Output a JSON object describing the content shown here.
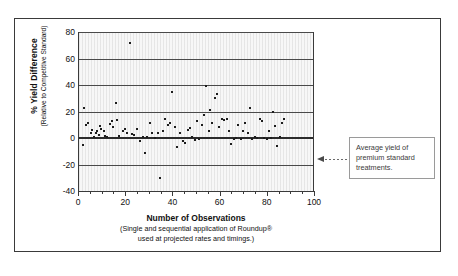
{
  "figure": {
    "frame_border_color": "#3a3a3a",
    "shadow_color": "#8d8d8d",
    "plot_background": "#f7f7f7"
  },
  "annotation": {
    "line1": "Average yield of",
    "line2": "premium standard",
    "line3": "treatments.",
    "arrow_icon": "dotted-left-arrow-icon"
  },
  "chart_data": {
    "type": "scatter",
    "title": "",
    "xlabel": "Number of Observations",
    "xlabel_sub1": "(Single and sequential application of Roundup®",
    "xlabel_sub2": "used at projected rates and timings.)",
    "ylabel": "% Yield Difference",
    "ylabel_sub": "(Relative to Competitive Standard)",
    "xlim": [
      0,
      100
    ],
    "ylim": [
      -40,
      80
    ],
    "xticks": [
      0,
      20,
      40,
      60,
      80,
      100
    ],
    "xtick_labels": [
      "0",
      "20",
      "40",
      "60",
      "80",
      "100"
    ],
    "x_minor_tick_step": 5,
    "yticks": [
      80,
      60,
      40,
      20,
      0,
      -20,
      -40
    ],
    "ytick_labels": [
      "80",
      "60",
      "40",
      "20",
      "0",
      "-20",
      "-40"
    ],
    "grid": "horizontal",
    "reference_line": {
      "y": 0,
      "label": "Average yield of premium standard treatments."
    },
    "legend": "none",
    "marker_color": "#1d1d1d",
    "points": [
      [
        1.5,
        -5.5
      ],
      [
        2.0,
        23.0
      ],
      [
        3.0,
        9.5
      ],
      [
        4.0,
        11.0
      ],
      [
        5.0,
        3.5
      ],
      [
        5.5,
        6.0
      ],
      [
        6.5,
        1.0
      ],
      [
        7.0,
        4.0
      ],
      [
        7.5,
        5.0
      ],
      [
        8.5,
        2.0
      ],
      [
        9.0,
        9.0
      ],
      [
        9.5,
        6.5
      ],
      [
        10.5,
        5.0
      ],
      [
        11.0,
        1.5
      ],
      [
        12.0,
        0.5
      ],
      [
        13.0,
        10.5
      ],
      [
        14.0,
        13.0
      ],
      [
        14.5,
        8.0
      ],
      [
        15.5,
        26.5
      ],
      [
        16.0,
        13.5
      ],
      [
        17.0,
        1.5
      ],
      [
        18.5,
        5.5
      ],
      [
        19.5,
        6.5
      ],
      [
        20.5,
        4.0
      ],
      [
        21.5,
        71.5
      ],
      [
        22.5,
        3.0
      ],
      [
        23.5,
        2.0
      ],
      [
        24.5,
        6.5
      ],
      [
        26.0,
        -2.0
      ],
      [
        27.0,
        1.0
      ],
      [
        28.0,
        -11.5
      ],
      [
        29.0,
        0.5
      ],
      [
        30.0,
        11.0
      ],
      [
        31.0,
        4.0
      ],
      [
        32.0,
        0.0
      ],
      [
        33.5,
        3.5
      ],
      [
        34.5,
        -30.5
      ],
      [
        35.5,
        5.5
      ],
      [
        36.5,
        14.0
      ],
      [
        37.5,
        9.5
      ],
      [
        38.5,
        11.0
      ],
      [
        39.5,
        34.5
      ],
      [
        40.5,
        8.0
      ],
      [
        41.5,
        -6.5
      ],
      [
        43.0,
        4.0
      ],
      [
        44.0,
        -2.5
      ],
      [
        45.0,
        -3.5
      ],
      [
        46.0,
        6.0
      ],
      [
        47.0,
        7.5
      ],
      [
        48.0,
        0.5
      ],
      [
        49.0,
        -1.5
      ],
      [
        50.0,
        12.5
      ],
      [
        51.0,
        -0.5
      ],
      [
        52.0,
        9.5
      ],
      [
        53.0,
        17.0
      ],
      [
        54.0,
        39.5
      ],
      [
        55.0,
        5.0
      ],
      [
        55.5,
        21.5
      ],
      [
        56.5,
        11.0
      ],
      [
        57.5,
        30.5
      ],
      [
        58.5,
        33.5
      ],
      [
        59.5,
        8.5
      ],
      [
        60.5,
        14.0
      ],
      [
        61.5,
        13.5
      ],
      [
        62.5,
        14.5
      ],
      [
        63.5,
        5.5
      ],
      [
        64.5,
        -4.5
      ],
      [
        65.5,
        -1.0
      ],
      [
        66.5,
        0.0
      ],
      [
        67.5,
        9.5
      ],
      [
        68.5,
        -0.5
      ],
      [
        69.5,
        5.0
      ],
      [
        70.5,
        11.5
      ],
      [
        71.5,
        3.5
      ],
      [
        72.5,
        23.0
      ],
      [
        73.5,
        -1.0
      ],
      [
        74.5,
        1.0
      ],
      [
        75.5,
        0.0
      ],
      [
        76.5,
        14.5
      ],
      [
        77.5,
        12.5
      ],
      [
        78.5,
        0.0
      ],
      [
        79.5,
        -0.5
      ],
      [
        80.5,
        5.5
      ],
      [
        81.5,
        0.0
      ],
      [
        82.0,
        19.5
      ],
      [
        83.0,
        9.0
      ],
      [
        84.0,
        -6.0
      ],
      [
        85.0,
        0.5
      ],
      [
        86.0,
        11.5
      ],
      [
        87.0,
        14.0
      ]
    ]
  }
}
